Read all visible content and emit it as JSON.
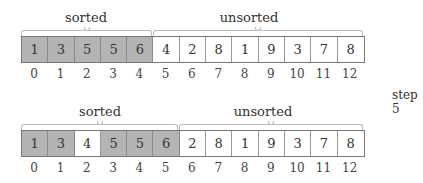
{
  "step_label": "step 5",
  "before": {
    "sorted_label": "sorted",
    "unsorted_label": "unsorted",
    "sorted_count": 5,
    "cells": [
      {
        "value": "1",
        "sorted": true
      },
      {
        "value": "3",
        "sorted": true
      },
      {
        "value": "5",
        "sorted": true
      },
      {
        "value": "5",
        "sorted": true
      },
      {
        "value": "6",
        "sorted": true
      },
      {
        "value": "4",
        "sorted": false
      },
      {
        "value": "2",
        "sorted": false
      },
      {
        "value": "8",
        "sorted": false
      },
      {
        "value": "1",
        "sorted": false
      },
      {
        "value": "9",
        "sorted": false
      },
      {
        "value": "3",
        "sorted": false
      },
      {
        "value": "7",
        "sorted": false
      },
      {
        "value": "8",
        "sorted": false
      }
    ],
    "indices": [
      "0",
      "1",
      "2",
      "3",
      "4",
      "5",
      "6",
      "7",
      "8",
      "9",
      "10",
      "11",
      "12"
    ]
  },
  "after": {
    "sorted_label": "sorted",
    "unsorted_label": "unsorted",
    "sorted_count": 6,
    "cells": [
      {
        "value": "1",
        "sorted": true
      },
      {
        "value": "3",
        "sorted": true
      },
      {
        "value": "4",
        "sorted": false
      },
      {
        "value": "5",
        "sorted": true
      },
      {
        "value": "5",
        "sorted": true
      },
      {
        "value": "6",
        "sorted": true
      },
      {
        "value": "2",
        "sorted": false
      },
      {
        "value": "8",
        "sorted": false
      },
      {
        "value": "1",
        "sorted": false
      },
      {
        "value": "9",
        "sorted": false
      },
      {
        "value": "3",
        "sorted": false
      },
      {
        "value": "7",
        "sorted": false
      },
      {
        "value": "8",
        "sorted": false
      }
    ],
    "indices": [
      "0",
      "1",
      "2",
      "3",
      "4",
      "5",
      "6",
      "7",
      "8",
      "9",
      "10",
      "11",
      "12"
    ]
  }
}
